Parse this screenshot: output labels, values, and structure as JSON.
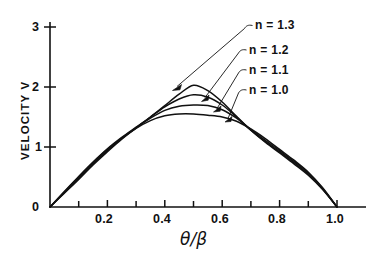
{
  "chart_data": {
    "type": "line",
    "title": "",
    "subtitle": "",
    "xlabel": "θ/β",
    "ylabel": "VELOCITY V",
    "xlim": [
      0,
      1.0
    ],
    "ylim": [
      0,
      3
    ],
    "grid": false,
    "legend_position": "inside-upper-right-with-leader-lines",
    "x_ticks_major": [
      "0.2",
      "0.4",
      "0.6",
      "0.8",
      "1.0"
    ],
    "x_tick_values_major": [
      0.2,
      0.4,
      0.6,
      0.8,
      1.0
    ],
    "x_tick_values_minor": [
      0.1,
      0.3,
      0.5,
      0.7,
      0.9
    ],
    "y_ticks": [
      "0",
      "1",
      "2",
      "3"
    ],
    "y_tick_values": [
      0,
      1,
      2,
      3
    ],
    "x": [
      0.0,
      0.05,
      0.1,
      0.15,
      0.2,
      0.25,
      0.3,
      0.35,
      0.4,
      0.45,
      0.5,
      0.55,
      0.6,
      0.65,
      0.7,
      0.75,
      0.8,
      0.85,
      0.9,
      0.95,
      1.0
    ],
    "series": [
      {
        "name": "n = 1.3",
        "label": "n = 1.3",
        "n": 1.3,
        "peak_x": 0.5,
        "peak_y": 2.03,
        "values": [
          0.0,
          0.26,
          0.51,
          0.75,
          0.97,
          1.16,
          1.33,
          1.5,
          1.69,
          1.88,
          2.03,
          1.94,
          1.75,
          1.51,
          1.28,
          1.08,
          0.9,
          0.72,
          0.53,
          0.29,
          0.0
        ]
      },
      {
        "name": "n = 1.2",
        "label": "n = 1.2",
        "n": 1.2,
        "peak_x": 0.5,
        "peak_y": 1.87,
        "values": [
          0.0,
          0.25,
          0.5,
          0.74,
          0.96,
          1.15,
          1.32,
          1.5,
          1.67,
          1.8,
          1.87,
          1.83,
          1.7,
          1.5,
          1.28,
          1.09,
          0.92,
          0.74,
          0.55,
          0.3,
          0.0
        ]
      },
      {
        "name": "n = 1.1",
        "label": "n = 1.1",
        "n": 1.1,
        "peak_x": 0.5,
        "peak_y": 1.7,
        "values": [
          0.0,
          0.24,
          0.48,
          0.72,
          0.94,
          1.14,
          1.32,
          1.48,
          1.61,
          1.68,
          1.7,
          1.69,
          1.62,
          1.48,
          1.29,
          1.11,
          0.94,
          0.76,
          0.57,
          0.31,
          0.0
        ]
      },
      {
        "name": "n = 1.0",
        "label": "n = 1.0",
        "n": 1.0,
        "peak_x": 0.5,
        "peak_y": 1.55,
        "values": [
          0.0,
          0.23,
          0.46,
          0.7,
          0.92,
          1.13,
          1.31,
          1.44,
          1.52,
          1.55,
          1.55,
          1.53,
          1.5,
          1.43,
          1.3,
          1.14,
          0.96,
          0.78,
          0.58,
          0.32,
          0.0
        ]
      }
    ],
    "annotations": [
      {
        "text": "n = 1.3",
        "target_x": 0.44,
        "target_y": 2.0,
        "has_arrow": true
      },
      {
        "text": "n = 1.2",
        "target_x": 0.535,
        "target_y": 1.83,
        "has_arrow": true
      },
      {
        "text": "n = 1.1",
        "target_x": 0.575,
        "target_y": 1.64,
        "has_arrow": true
      },
      {
        "text": "n = 1.0",
        "target_x": 0.615,
        "target_y": 1.47,
        "has_arrow": true
      }
    ]
  },
  "axes": {
    "y_title": "VELOCITY V",
    "x_title": "θ/β",
    "y_tick_labels": [
      "3",
      "2",
      "1",
      "0"
    ],
    "x_tick_labels": [
      "0.2",
      "0.4",
      "0.6",
      "0.8",
      "1.0"
    ]
  },
  "labels": {
    "n13": "n = 1.3",
    "n12": "n = 1.2",
    "n11": "n = 1.1",
    "n10": "n = 1.0"
  },
  "colors": {
    "ink": "#111111",
    "background": "#ffffff",
    "curve": "#111111"
  }
}
